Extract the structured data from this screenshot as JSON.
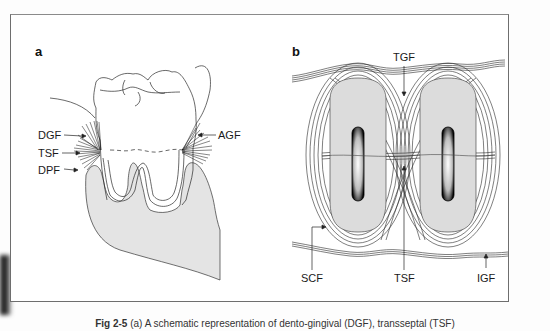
{
  "figure": {
    "panels": [
      {
        "id": "a",
        "label": "a",
        "annotations": [
          "DGF",
          "TSF",
          "DPF",
          "AGF"
        ]
      },
      {
        "id": "b",
        "label": "b",
        "annotations": [
          "TGF",
          "SCF",
          "TSF",
          "IGF"
        ]
      }
    ],
    "caption": {
      "number": "Fig 2-5",
      "text": "(a) A schematic representation of dento-gingival (DGF), transseptal (TSF)"
    },
    "colors": {
      "line": "#2a2a2a",
      "bone_fill": "#dcdcdc",
      "frame": "#6e6e6e"
    }
  }
}
